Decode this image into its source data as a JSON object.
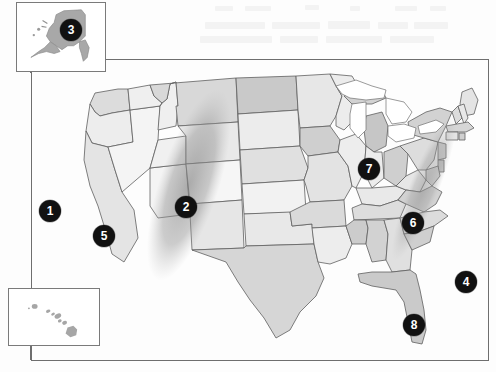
{
  "figure": {
    "type": "map",
    "projection_note": "contiguous United States with Alaska and Hawaii insets"
  },
  "frame": {
    "name": "map-border",
    "x": 31,
    "y": 59,
    "width": 458,
    "height": 302
  },
  "insets": [
    {
      "id": "alaska",
      "name": "alaska-inset",
      "label": "",
      "x": 16,
      "y": 2,
      "width": 90,
      "height": 70
    },
    {
      "id": "hawaii",
      "name": "hawaii-inset",
      "label": "",
      "x": 8,
      "y": 288,
      "width": 92,
      "height": 58
    }
  ],
  "markers": [
    {
      "id": "m1",
      "label": "1",
      "x": 50,
      "y": 211,
      "region": "pacific-ocean-offshore-west",
      "size": "normal"
    },
    {
      "id": "m2",
      "label": "2",
      "x": 186,
      "y": 207,
      "region": "colorado-wyoming-band",
      "size": "normal"
    },
    {
      "id": "m3",
      "label": "3",
      "x": 71,
      "y": 30,
      "region": "alaska-inset",
      "size": "normal"
    },
    {
      "id": "m4",
      "label": "4",
      "x": 466,
      "y": 282,
      "region": "atlantic-ocean-offshore-east",
      "size": "normal"
    },
    {
      "id": "m5",
      "label": "5",
      "x": 104,
      "y": 236,
      "region": "california",
      "size": "normal"
    },
    {
      "id": "m6",
      "label": "6",
      "x": 413,
      "y": 223,
      "region": "virginia",
      "size": "normal"
    },
    {
      "id": "m7",
      "label": "7",
      "x": 369,
      "y": 169,
      "region": "lake-michigan",
      "size": "normal"
    },
    {
      "id": "m8",
      "label": "8",
      "x": 414,
      "y": 325,
      "region": "florida",
      "size": "normal"
    }
  ],
  "bands": [
    {
      "id": "band-west",
      "name": "shaded-diagonal-band-west",
      "note": "dark diagonal swath from Montana through Colorado/New Mexico"
    },
    {
      "id": "band-east",
      "name": "shaded-diagonal-band-east",
      "note": "dark diagonal swath from New England through the Carolinas"
    }
  ],
  "colors": {
    "marker_fill": "#111111",
    "marker_text": "#ffffff",
    "border": "#6e6e6e",
    "state_outline": "#5f5f5f",
    "land_light": "#f2f2f2",
    "land_mid": "#dcdcdc",
    "land_dark": "#c2c2c2",
    "band_shade": "#9e9e9e",
    "water": "#ffffff",
    "background": "#fdfdfd"
  }
}
